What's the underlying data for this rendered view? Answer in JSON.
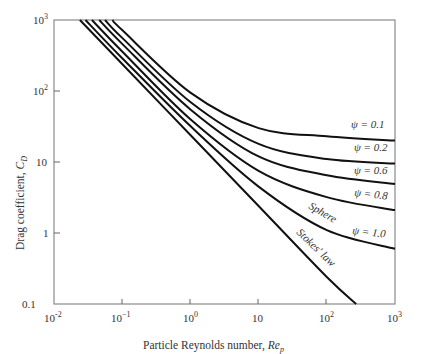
{
  "chart_data": {
    "type": "line",
    "title": "",
    "xlabel": "Particle Reynolds number, Re_p",
    "ylabel": "Drag coefficient, C_D",
    "xscale": "log",
    "yscale": "log",
    "xlim": [
      0.01,
      1000
    ],
    "ylim": [
      0.1,
      1000
    ],
    "grid": false,
    "legend": "inline labels",
    "x_ticks": [
      {
        "value": 0.01,
        "label": "10^-2"
      },
      {
        "value": 0.1,
        "label": "10^-1"
      },
      {
        "value": 1,
        "label": "10^0"
      },
      {
        "value": 10,
        "label": "10"
      },
      {
        "value": 100,
        "label": "10^2"
      },
      {
        "value": 1000,
        "label": "10^3"
      }
    ],
    "y_ticks": [
      {
        "value": 0.1,
        "label": "0.1"
      },
      {
        "value": 1,
        "label": "1"
      },
      {
        "value": 10,
        "label": "10"
      },
      {
        "value": 100,
        "label": "10^2"
      },
      {
        "value": 1000,
        "label": "10^3"
      }
    ],
    "series": [
      {
        "name": "Stokes' law",
        "x": [
          0.024,
          0.1,
          1,
          10,
          100,
          270
        ],
        "y": [
          1000,
          240,
          24,
          2.4,
          0.24,
          0.1
        ]
      },
      {
        "name": "Sphere (ψ = 1.0)",
        "x": [
          0.029,
          0.1,
          1,
          10,
          100,
          1000
        ],
        "y": [
          1000,
          290,
          32,
          4.5,
          1.1,
          0.6
        ]
      },
      {
        "name": "ψ = 0.8",
        "x": [
          0.036,
          0.1,
          1,
          10,
          100,
          1000
        ],
        "y": [
          1000,
          360,
          40,
          7.5,
          3.2,
          2.1
        ]
      },
      {
        "name": "ψ = 0.6",
        "x": [
          0.046,
          0.1,
          1,
          10,
          100,
          1000
        ],
        "y": [
          1000,
          460,
          55,
          12,
          6.5,
          4.9
        ]
      },
      {
        "name": "ψ = 0.2",
        "x": [
          0.056,
          0.1,
          1,
          10,
          100,
          1000
        ],
        "y": [
          1000,
          560,
          70,
          18,
          11,
          9.5
        ]
      },
      {
        "name": "ψ = 0.1",
        "x": [
          0.072,
          0.1,
          1,
          10,
          100,
          1000
        ],
        "y": [
          1000,
          720,
          95,
          30,
          23,
          20
        ]
      }
    ],
    "annotations": [
      "ψ = 0.1",
      "ψ = 0.2",
      "ψ = 0.6",
      "ψ = 0.8",
      "Sphere",
      "ψ = 1.0",
      "Stokes' law"
    ]
  },
  "labels": {
    "xlabel_text": "Particle Reynolds number, ",
    "xlabel_var": "Re",
    "xlabel_sub": "p",
    "ylabel_text": "Drag coefficient, ",
    "ylabel_var": "C",
    "ylabel_sub": "D",
    "psi_01": "ψ = 0.1",
    "psi_02": "ψ = 0.2",
    "psi_06": "ψ = 0.6",
    "psi_08": "ψ = 0.8",
    "sphere": "Sphere",
    "psi_10": "ψ = 1.0",
    "stokes": "Stokes' law",
    "xt0_base": "10",
    "xt0_exp": "-2",
    "xt1_base": "10",
    "xt1_exp": "−1",
    "xt2_base": "10",
    "xt2_exp": "0",
    "xt3": "10",
    "xt4_base": "10",
    "xt4_exp": "2",
    "xt5_base": "10",
    "xt5_exp": "3",
    "yt0": "0.1",
    "yt1": "1",
    "yt2": "10",
    "yt3_base": "10",
    "yt3_exp": "2",
    "yt4_base": "10",
    "yt4_exp": "3"
  }
}
